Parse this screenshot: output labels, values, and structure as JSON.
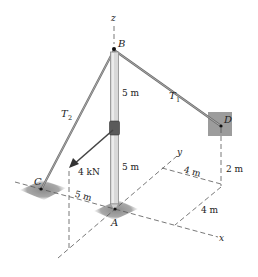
{
  "figure": {
    "type": "3D statics diagram (pole with guy cables)",
    "axes": {
      "x": "x",
      "y": "y",
      "z": "z"
    },
    "points": {
      "A": "A",
      "B": "B",
      "C": "C",
      "D": "D"
    },
    "tensions": {
      "t1": {
        "base": "T",
        "sub": "1"
      },
      "t2": {
        "base": "T",
        "sub": "2"
      }
    },
    "force_label": "4 kN",
    "dimensions": {
      "upper_pole": "5 m",
      "lower_pole": "5 m",
      "c_offset": "5 m",
      "d_y_offset": "4 m",
      "d_x_offset": "4 m",
      "d_height": "2 m"
    },
    "colors": {
      "pole": "#d9d9d9",
      "pole_edge": "#8a8a8a",
      "cable": "#6e6e6e",
      "pad": "#9a9a9a",
      "collar": "#5a5a5a",
      "dash": "#555555"
    }
  }
}
